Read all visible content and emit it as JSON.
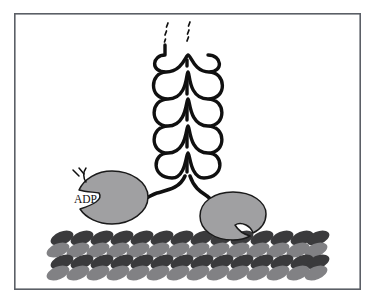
{
  "figure": {
    "background_color": "#ffffff",
    "frame": {
      "x": 14,
      "y": 13,
      "width": 347,
      "height": 277,
      "stroke_color": "#5b5f66",
      "fill_color": "#ffffff"
    }
  },
  "labels": {
    "adp": "ADP"
  },
  "colors": {
    "outline": "#101010",
    "head_fill": "#a0a0a2",
    "filament_dark": "#3a3a3c",
    "filament_light": "#818184",
    "frame_stroke": "#5b5f66",
    "background": "#ffffff"
  },
  "coiled_coil": {
    "name": "coiled-coil-tail",
    "description": "two intertwined alpha-helical strands",
    "turns": 5,
    "center_x": 187,
    "top_y": 44,
    "bottom_y": 178,
    "strand_count": 2,
    "loop_half_width": 19,
    "loop_height": 27
  },
  "continuation_dashes": {
    "name": "tail-continuation-dashes",
    "columns": 2,
    "left_column_x": 166,
    "right_column_x": 187,
    "marks_per_column": 3,
    "top_y": 22
  },
  "neck": {
    "fork_y": 180,
    "fork_x": 187,
    "left_end_x": 140,
    "left_end_y": 199,
    "right_end_x": 214,
    "right_end_y": 204
  },
  "heads": [
    {
      "name": "motor-head-left",
      "label": "ADP",
      "state": "ADP-bound, detached",
      "center_x": 112,
      "center_y": 197,
      "radius_x": 37,
      "radius_y": 27,
      "cleft_side": "left",
      "label_x": 76,
      "label_y": 202,
      "has_release_marks": true
    },
    {
      "name": "motor-head-right",
      "label": "",
      "state": "bound to filament",
      "center_x": 233,
      "center_y": 216,
      "radius_x": 33,
      "radius_y": 24,
      "cleft_side": "right",
      "has_release_marks": false
    }
  ],
  "release_marks": {
    "name": "adp-release-marks",
    "count": 3,
    "origin_x": 78,
    "origin_y": 176
  },
  "filament": {
    "name": "actin-filament",
    "rows": 4,
    "row_colors": [
      "#3a3a3c",
      "#818184",
      "#3a3a3c",
      "#818184"
    ],
    "subunits_per_row": 13,
    "left_x": 56,
    "right_x": 320,
    "top_y": 232,
    "row_height": 13,
    "subunit_rx": 12,
    "subunit_ry": 6.5,
    "tilt_degrees": -22
  }
}
